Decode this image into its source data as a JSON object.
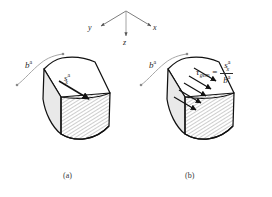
{
  "figure": {
    "type": "engineering-diagram",
    "background_color": "#ffffff",
    "line_color": "#1a1a1a",
    "leader_color": "#8a8a8a",
    "face_fill_top": "#ffffff",
    "face_fill_front": "#e8e8e8",
    "hatch_color": "#6e6e6e"
  },
  "axes": {
    "label_y": "y",
    "label_x": "x",
    "label_z": "z",
    "origin_note": "three arrows from a common origin"
  },
  "panel_a": {
    "caption": "(a)",
    "dimension_label_base": "b",
    "dimension_label_sup": "a",
    "force_label_base": "s",
    "force_label_sub": "x",
    "force_label_sup": "a",
    "arrow_count": 1
  },
  "panel_b": {
    "caption": "(b)",
    "dimension_label_base": "b",
    "dimension_label_sup": "a",
    "arrow_count": 5,
    "formula": {
      "lhs_base": "τ",
      "lhs_sub": "gem",
      "equals": "=",
      "numerator_base": "s",
      "numerator_sub": "x",
      "numerator_sup": "a",
      "denominator_base": "b",
      "denominator_sup": "a"
    }
  }
}
